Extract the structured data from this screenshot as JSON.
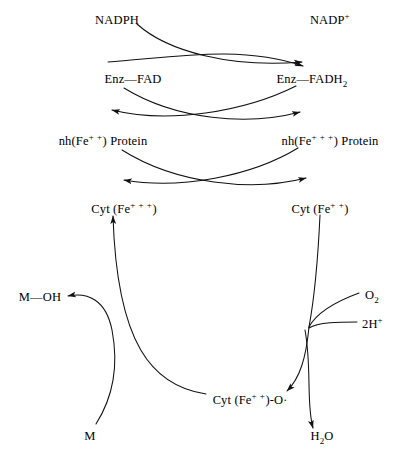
{
  "diagram": {
    "stroke_color": "#111111",
    "background_color": "#ffffff",
    "width": 396,
    "height": 455
  },
  "labels": {
    "nadph": "NADPH",
    "nadp_plus": "NADP",
    "nadp_plus_sup": "+",
    "enz_fad": "Enz—FAD",
    "enz_fadh2": "Enz—FADH",
    "enz_fadh2_sub": "2",
    "nh_fe2_protein_pre": "nh(Fe",
    "nh_fe2_protein_sup": "+ +",
    "nh_fe2_protein_post": ") Protein",
    "nh_fe3_protein_pre": "nh(Fe",
    "nh_fe3_protein_sup": "+ + +",
    "nh_fe3_protein_post": ") Protein",
    "cyt_fe3_pre": "Cyt (Fe",
    "cyt_fe3_sup": "+ + +",
    "cyt_fe3_post": ")",
    "cyt_fe2_pre": "Cyt (Fe",
    "cyt_fe2_sup": "+ +",
    "cyt_fe2_post": ")",
    "cyt_fe2_o_pre": "Cyt (Fe",
    "cyt_fe2_o_sup": "+ +",
    "cyt_fe2_o_post": ")-O",
    "cyt_fe2_o_radical": "·",
    "m_oh": "M—OH",
    "m": "M",
    "o2": "O",
    "o2_sub": "2",
    "two_h_plus": "2H",
    "two_h_plus_sup": "+",
    "h2o_pre": "H",
    "h2o_sub": "2",
    "h2o_post": "O"
  },
  "label_positions": {
    "nadph": {
      "x": 117,
      "y": 14
    },
    "nadp_plus": {
      "x": 330,
      "y": 14
    },
    "enz_fad": {
      "x": 133,
      "y": 73
    },
    "enz_fadh2": {
      "x": 312,
      "y": 73
    },
    "nh_fe2_protein": {
      "x": 103,
      "y": 135
    },
    "nh_fe3_protein": {
      "x": 330,
      "y": 135
    },
    "cyt_fe3": {
      "x": 124,
      "y": 203
    },
    "cyt_fe2": {
      "x": 320,
      "y": 203
    },
    "m_oh": {
      "x": 40,
      "y": 297
    },
    "m": {
      "x": 90,
      "y": 437
    },
    "o2": {
      "x": 374,
      "y": 295
    },
    "two_h_plus": {
      "x": 373,
      "y": 324
    },
    "h2o": {
      "x": 322,
      "y": 437
    },
    "cyt_fe2_o": {
      "x": 250,
      "y": 400
    }
  },
  "reaction_steps": [
    {
      "id": "nadph-to-nadp",
      "from": "NADPH",
      "to": "NADP+"
    },
    {
      "id": "enzfad-to-enzfadh2",
      "from": "Enz—FAD",
      "to": "Enz—FADH2"
    },
    {
      "id": "enzfadh2-to-enzfad",
      "from": "Enz—FADH2",
      "to": "Enz—FAD"
    },
    {
      "id": "nhfe2-to-nhfe3",
      "from": "nh(Fe++) Protein",
      "to": "nh(Fe+++) Protein"
    },
    {
      "id": "nhfe3-to-nhfe2",
      "from": "nh(Fe+++) Protein",
      "to": "nh(Fe++) Protein"
    },
    {
      "id": "cytfe3-to-cytfe2",
      "from": "Cyt (Fe+++)",
      "to": "Cyt (Fe++)"
    },
    {
      "id": "cytfe2-to-cytfe2o",
      "from": "Cyt (Fe++)",
      "to": "Cyt (Fe++)-O·"
    },
    {
      "id": "cytfe2o-to-cytfe3",
      "from": "Cyt (Fe++)-O·",
      "to": "Cyt (Fe+++)"
    },
    {
      "id": "m-to-moh",
      "from": "M",
      "to": "M—OH"
    },
    {
      "id": "o2-input",
      "from": "O2",
      "to": "Cyt (Fe++)-O·"
    },
    {
      "id": "2h-input",
      "from": "2H+",
      "to": "Cyt (Fe++)-O·"
    },
    {
      "id": "h2o-output",
      "from": "node",
      "to": "H2O"
    }
  ]
}
